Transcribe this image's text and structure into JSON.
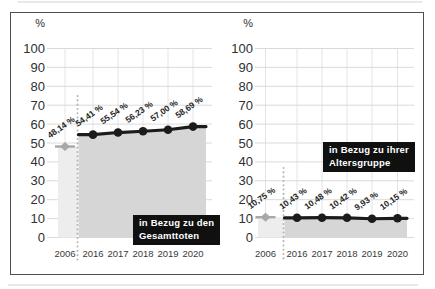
{
  "frame": {
    "border_color": "#4f4f4f",
    "background": "#ffffff"
  },
  "chart_data": [
    {
      "type": "area",
      "title": "",
      "unit": "%",
      "xlabel": "",
      "ylabel": "%",
      "categories": [
        "2006",
        "2016",
        "2017",
        "2018",
        "2019",
        "2020"
      ],
      "values": [
        48.14,
        54.41,
        55.54,
        56.23,
        57.0,
        58.69
      ],
      "value_labels": [
        "48,14 %",
        "54,41 %",
        "55,54 %",
        "56,23 %",
        "57,00 %",
        "58,69 %"
      ],
      "annotation": {
        "line1": "in Bezug zu den",
        "line2": "Gesamttoten"
      },
      "highlighted_category": "2006",
      "ylim": [
        0,
        100
      ],
      "yticks": [
        0,
        10,
        20,
        30,
        40,
        50,
        60,
        70,
        80,
        90,
        100
      ],
      "grid": true,
      "legend": "none",
      "colors": {
        "line": "#1b1b1b",
        "marker": "#1b1b1b",
        "area": "#d6d6d6",
        "highlight_area": "#ededed",
        "baseline_point": "#a8a8a8",
        "grid": "#dadada",
        "vgrid": "#e4e4e4",
        "dotted_divider": "#b5b5b5",
        "annotation_bg": "#101010",
        "annotation_text": "#ffffff"
      }
    },
    {
      "type": "area",
      "title": "",
      "unit": "%",
      "xlabel": "",
      "ylabel": "%",
      "categories": [
        "2006",
        "2016",
        "2017",
        "2018",
        "2019",
        "2020"
      ],
      "values": [
        10.75,
        10.43,
        10.48,
        10.42,
        9.93,
        10.15
      ],
      "value_labels": [
        "10,75 %",
        "10,43 %",
        "10,48 %",
        "10,42 %",
        "9,93 %",
        "10,15 %"
      ],
      "annotation": {
        "line1": "in Bezug zu ihrer",
        "line2": "Altersgruppe"
      },
      "highlighted_category": "2006",
      "ylim": [
        0,
        100
      ],
      "yticks": [
        0,
        10,
        20,
        30,
        40,
        50,
        60,
        70,
        80,
        90,
        100
      ],
      "grid": true,
      "legend": "none",
      "colors": {
        "line": "#1b1b1b",
        "marker": "#1b1b1b",
        "area": "#d6d6d6",
        "highlight_area": "#ededed",
        "baseline_point": "#a8a8a8",
        "grid": "#dadada",
        "vgrid": "#e4e4e4",
        "dotted_divider": "#b5b5b5",
        "annotation_bg": "#101010",
        "annotation_text": "#ffffff"
      }
    }
  ]
}
